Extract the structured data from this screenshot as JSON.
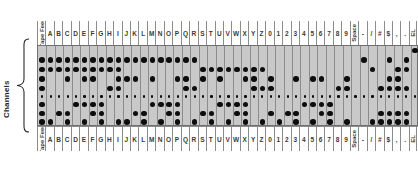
{
  "labels": {
    "channels": "Channels",
    "tape_feed": "Tape Feed"
  },
  "rows": [
    {
      "id": "eol",
      "label": "End\nof Line",
      "label_line1": "End",
      "label_line2": "of Line"
    },
    {
      "id": "x",
      "label": "X"
    },
    {
      "id": "zero",
      "label": "0"
    },
    {
      "id": "check",
      "label": "Check"
    },
    {
      "id": "eight",
      "label": "8"
    },
    {
      "id": "sprk",
      "label": ""
    },
    {
      "id": "four",
      "label": "4"
    },
    {
      "id": "two",
      "label": "2"
    },
    {
      "id": "one",
      "label": "1"
    }
  ],
  "columns": [
    "Tape Feed",
    "A",
    "B",
    "C",
    "D",
    "E",
    "F",
    "G",
    "H",
    "I",
    "J",
    "K",
    "L",
    "M",
    "N",
    "O",
    "P",
    "Q",
    "R",
    "S",
    "T",
    "U",
    "V",
    "W",
    "X",
    "Y",
    "Z",
    "0",
    "1",
    "2",
    "3",
    "4",
    "5",
    "6",
    "7",
    "8",
    "9",
    "Space",
    "-",
    "/",
    "#",
    "$",
    ",",
    ".",
    "EL"
  ],
  "rotated_columns": [
    "Tape Feed",
    "Space",
    "EL"
  ],
  "chart_data": {
    "type": "table",
    "xlabel": "Character",
    "ylabel": "Channels",
    "row_order": [
      "End of Line",
      "X",
      "0",
      "Check",
      "8",
      "sprocket",
      "4",
      "2",
      "1"
    ],
    "grid": true,
    "note": "1 = hole punched in that channel for the character; sprocket row is punched for every column",
    "punches": {
      "Tape Feed": [
        "X",
        "0",
        "Check",
        "8",
        "4",
        "2",
        "1"
      ],
      "A": [
        "X",
        "0",
        "1"
      ],
      "B": [
        "X",
        "0",
        "2"
      ],
      "C": [
        "X",
        "0",
        "Check",
        "2",
        "1"
      ],
      "D": [
        "X",
        "0",
        "4"
      ],
      "E": [
        "X",
        "0",
        "Check",
        "4",
        "1"
      ],
      "F": [
        "X",
        "0",
        "Check",
        "4",
        "2"
      ],
      "G": [
        "X",
        "0",
        "4",
        "2",
        "1"
      ],
      "H": [
        "X",
        "0",
        "8"
      ],
      "I": [
        "X",
        "0",
        "Check",
        "8",
        "1"
      ],
      "J": [
        "X",
        "Check",
        "1"
      ],
      "K": [
        "X",
        "Check",
        "2"
      ],
      "L": [
        "X",
        "2",
        "1"
      ],
      "M": [
        "X",
        "Check",
        "4"
      ],
      "N": [
        "X",
        "4",
        "1"
      ],
      "O": [
        "X",
        "4",
        "2"
      ],
      "P": [
        "X",
        "Check",
        "4",
        "2",
        "1"
      ],
      "Q": [
        "X",
        "Check",
        "8"
      ],
      "R": [
        "X",
        "8",
        "1"
      ],
      "S": [
        "0",
        "Check",
        "2"
      ],
      "T": [
        "0",
        "2",
        "1"
      ],
      "U": [
        "0",
        "Check",
        "4"
      ],
      "V": [
        "0",
        "4",
        "1"
      ],
      "W": [
        "0",
        "4",
        "2"
      ],
      "X": [
        "0",
        "Check",
        "4",
        "2",
        "1"
      ],
      "Y": [
        "0",
        "Check",
        "8"
      ],
      "Z": [
        "0",
        "8",
        "1"
      ],
      "0": [
        "Check",
        "8",
        "2"
      ],
      "1": [
        "1"
      ],
      "2": [
        "2"
      ],
      "3": [
        "Check",
        "2",
        "1"
      ],
      "4": [
        "4"
      ],
      "5": [
        "Check",
        "4",
        "1"
      ],
      "6": [
        "Check",
        "4",
        "2"
      ],
      "7": [
        "4",
        "2",
        "1"
      ],
      "8": [
        "8"
      ],
      "9": [
        "Check",
        "8",
        "1"
      ],
      "Space": [],
      "-": [
        "X"
      ],
      "/": [
        "0",
        "1"
      ],
      "#": [
        "8",
        "2",
        "1"
      ],
      "$": [
        "X",
        "Check",
        "8",
        "2",
        "1"
      ],
      ",": [
        "0",
        "Check",
        "8",
        "2",
        "1"
      ],
      ".": [
        "X",
        "0",
        "8",
        "2",
        "1"
      ],
      "EL": [
        "End of Line"
      ]
    }
  }
}
